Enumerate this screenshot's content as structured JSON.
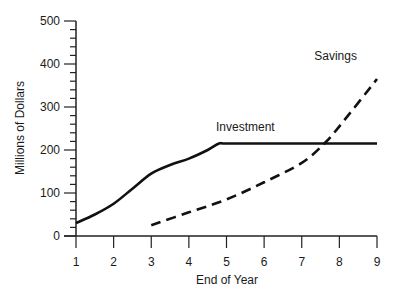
{
  "chart_data": {
    "type": "line",
    "title": "",
    "xlabel": "End of Year",
    "ylabel": "Millions of Dollars",
    "xlim": [
      1,
      9
    ],
    "ylim": [
      0,
      500
    ],
    "x_ticks": [
      1,
      2,
      3,
      4,
      5,
      6,
      7,
      8,
      9
    ],
    "y_ticks": [
      0,
      100,
      200,
      300,
      400,
      500
    ],
    "grid": false,
    "legend": "inline labels",
    "series": [
      {
        "name": "Investment",
        "style": "solid",
        "x": [
          1,
          1.5,
          2,
          2.5,
          3,
          3.5,
          4,
          4.5,
          4.8,
          5,
          6,
          7,
          8,
          9
        ],
        "values": [
          30,
          50,
          75,
          110,
          145,
          165,
          180,
          200,
          215,
          215,
          215,
          215,
          215,
          215
        ]
      },
      {
        "name": "Savings",
        "style": "dashed",
        "x": [
          3,
          4,
          5,
          6,
          7,
          7.6,
          8,
          9
        ],
        "values": [
          25,
          55,
          85,
          125,
          170,
          215,
          255,
          365
        ]
      }
    ],
    "annotations": [
      {
        "text": "Investment",
        "x": 5.5,
        "y": 245
      },
      {
        "text": "Savings",
        "x": 7.9,
        "y": 410
      }
    ]
  }
}
